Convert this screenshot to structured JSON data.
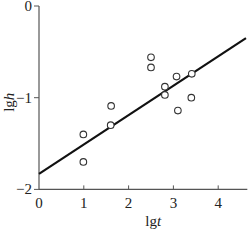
{
  "chart_data": {
    "type": "scatter",
    "title": "",
    "xlabel": "lgt",
    "ylabel": "lgh",
    "xlabel_parts": {
      "prefix": "lg",
      "var": "t"
    },
    "ylabel_parts": {
      "prefix": "lg",
      "var": "h"
    },
    "xlim": [
      0,
      4.65
    ],
    "ylim": [
      -2,
      0
    ],
    "x_ticks": [
      0,
      1,
      2,
      3,
      4
    ],
    "y_ticks": [
      0,
      -1,
      -2
    ],
    "x_tick_labels": [
      "0",
      "1",
      "2",
      "3",
      "4"
    ],
    "y_tick_labels": [
      "0",
      "−1",
      "−2"
    ],
    "grid": false,
    "legend": null,
    "series": [
      {
        "name": "observations",
        "marker": "open-circle",
        "points": [
          {
            "x": 0.99,
            "y": -1.4
          },
          {
            "x": 0.99,
            "y": -1.7
          },
          {
            "x": 1.61,
            "y": -1.09
          },
          {
            "x": 1.6,
            "y": -1.3
          },
          {
            "x": 2.5,
            "y": -0.56
          },
          {
            "x": 2.5,
            "y": -0.67
          },
          {
            "x": 2.81,
            "y": -0.88
          },
          {
            "x": 2.81,
            "y": -0.97
          },
          {
            "x": 3.07,
            "y": -0.77
          },
          {
            "x": 3.1,
            "y": -1.14
          },
          {
            "x": 3.41,
            "y": -0.74
          },
          {
            "x": 3.4,
            "y": -1.0
          }
        ]
      },
      {
        "name": "fit",
        "type": "line",
        "points": [
          {
            "x": 0,
            "y": -1.83
          },
          {
            "x": 4.62,
            "y": -0.35
          }
        ]
      }
    ]
  },
  "colors": {
    "axis": "#555555",
    "line": "#111111",
    "marker": "#333333"
  }
}
